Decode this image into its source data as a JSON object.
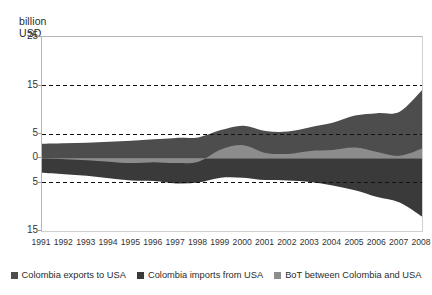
{
  "chart_data": {
    "type": "area",
    "title": "",
    "subtitle": "",
    "axis_title": "billion\nUSD",
    "xlabel": "",
    "ylabel": "billion USD",
    "grid": true,
    "gridlines_style": "dashed",
    "gridline_values": [
      15,
      5,
      -5
    ],
    "legend_position": "bottom",
    "ylim": [
      -15,
      25
    ],
    "ytick_labels": [
      "25",
      "15",
      "5",
      "0",
      "5",
      "15"
    ],
    "ytick_values": [
      25,
      15,
      5,
      0,
      -5,
      -15
    ],
    "categories": [
      "1991",
      "1992",
      "1993",
      "1994",
      "1995",
      "1996",
      "1997",
      "1998",
      "1999",
      "2000",
      "2001",
      "2002",
      "2003",
      "2004",
      "2005",
      "2006",
      "2007",
      "2008"
    ],
    "series": [
      {
        "name": "Colombia exports to USA",
        "color": "#4d4d4d",
        "values": [
          3.0,
          3.1,
          3.2,
          3.4,
          3.6,
          3.9,
          4.2,
          4.3,
          5.8,
          6.7,
          5.6,
          5.5,
          6.4,
          7.3,
          8.8,
          9.3,
          9.6,
          14.0
        ]
      },
      {
        "name": "Colombia imports from USA",
        "color": "#3a3a3a",
        "values": [
          -3.0,
          -3.3,
          -3.6,
          -4.1,
          -4.6,
          -4.7,
          -5.2,
          -5.0,
          -4.0,
          -4.0,
          -4.5,
          -4.6,
          -4.9,
          -5.6,
          -6.6,
          -8.0,
          -9.1,
          -12.0
        ]
      },
      {
        "name": "BoT between Colombia and USA",
        "color": "#8c8c8c",
        "values": [
          0.0,
          -0.2,
          -0.4,
          -0.7,
          -1.0,
          -0.8,
          -1.0,
          -0.7,
          1.8,
          2.7,
          1.1,
          0.9,
          1.5,
          1.7,
          2.2,
          1.3,
          0.5,
          2.0
        ]
      }
    ]
  },
  "legend": {
    "items": [
      {
        "label": "Colombia exports to USA",
        "color": "#4d4d4d"
      },
      {
        "label": "Colombia imports from USA",
        "color": "#3a3a3a"
      },
      {
        "label": "BoT between Colombia and USA",
        "color": "#8c8c8c"
      }
    ]
  }
}
